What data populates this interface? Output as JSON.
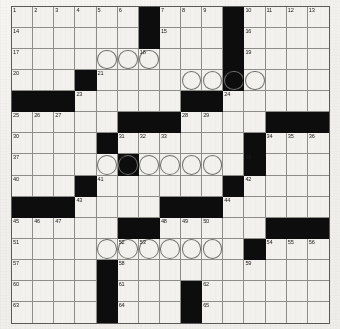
{
  "puzzle": {
    "type": "crossword-grid",
    "rows": 15,
    "columns": 15,
    "cell_size_px": 21.2,
    "colors": {
      "block": "#0d0d0d",
      "cell": "#f2f1ed",
      "grid_line": "#8d8d8a",
      "border": "#5a5a58",
      "paper": "#f1f0ec",
      "number_text": "#1b1b1b",
      "circle_stroke": "#6e6e6b"
    },
    "blocks": [
      [
        1,
        7
      ],
      [
        1,
        11
      ],
      [
        2,
        7
      ],
      [
        2,
        11
      ],
      [
        3,
        11
      ],
      [
        4,
        4
      ],
      [
        4,
        11
      ],
      [
        5,
        1
      ],
      [
        5,
        2
      ],
      [
        5,
        3
      ],
      [
        5,
        9
      ],
      [
        5,
        10
      ],
      [
        6,
        6
      ],
      [
        6,
        7
      ],
      [
        6,
        8
      ],
      [
        6,
        13
      ],
      [
        6,
        14
      ],
      [
        6,
        15
      ],
      [
        7,
        5
      ],
      [
        7,
        12
      ],
      [
        8,
        6
      ],
      [
        8,
        12
      ],
      [
        9,
        4
      ],
      [
        9,
        11
      ],
      [
        10,
        1
      ],
      [
        10,
        2
      ],
      [
        10,
        3
      ],
      [
        10,
        8
      ],
      [
        10,
        9
      ],
      [
        10,
        10
      ],
      [
        11,
        6
      ],
      [
        11,
        7
      ],
      [
        11,
        13
      ],
      [
        11,
        14
      ],
      [
        11,
        15
      ],
      [
        12,
        12
      ],
      [
        13,
        5
      ],
      [
        14,
        5
      ],
      [
        14,
        9
      ],
      [
        15,
        5
      ],
      [
        15,
        9
      ]
    ],
    "circles": [
      [
        3,
        5
      ],
      [
        3,
        6
      ],
      [
        3,
        7
      ],
      [
        4,
        9
      ],
      [
        4,
        10
      ],
      [
        4,
        11
      ],
      [
        4,
        12
      ],
      [
        8,
        5
      ],
      [
        8,
        6
      ],
      [
        8,
        7
      ],
      [
        8,
        8
      ],
      [
        8,
        9
      ],
      [
        8,
        10
      ],
      [
        12,
        5
      ],
      [
        12,
        6
      ],
      [
        12,
        7
      ],
      [
        12,
        8
      ],
      [
        12,
        9
      ],
      [
        12,
        10
      ]
    ],
    "numbers": [
      {
        "row": 1,
        "col": 1,
        "label": "1"
      },
      {
        "row": 1,
        "col": 2,
        "label": "2"
      },
      {
        "row": 1,
        "col": 3,
        "label": "3"
      },
      {
        "row": 1,
        "col": 4,
        "label": "4"
      },
      {
        "row": 1,
        "col": 5,
        "label": "5"
      },
      {
        "row": 1,
        "col": 6,
        "label": "6"
      },
      {
        "row": 1,
        "col": 8,
        "label": "7"
      },
      {
        "row": 1,
        "col": 9,
        "label": "8"
      },
      {
        "row": 1,
        "col": 10,
        "label": "9"
      },
      {
        "row": 1,
        "col": 12,
        "label": "10"
      },
      {
        "row": 1,
        "col": 13,
        "label": "11"
      },
      {
        "row": 1,
        "col": 14,
        "label": "12"
      },
      {
        "row": 1,
        "col": 15,
        "label": "13"
      },
      {
        "row": 2,
        "col": 1,
        "label": "14"
      },
      {
        "row": 2,
        "col": 8,
        "label": "15"
      },
      {
        "row": 2,
        "col": 12,
        "label": "16"
      },
      {
        "row": 3,
        "col": 1,
        "label": "17"
      },
      {
        "row": 3,
        "col": 7,
        "label": "18"
      },
      {
        "row": 3,
        "col": 12,
        "label": "19"
      },
      {
        "row": 4,
        "col": 1,
        "label": "20"
      },
      {
        "row": 4,
        "col": 5,
        "label": "21"
      },
      {
        "row": 4,
        "col": 11,
        "label": "22"
      },
      {
        "row": 5,
        "col": 4,
        "label": "23"
      },
      {
        "row": 5,
        "col": 11,
        "label": "24"
      },
      {
        "row": 6,
        "col": 1,
        "label": "25"
      },
      {
        "row": 6,
        "col": 2,
        "label": "26"
      },
      {
        "row": 6,
        "col": 3,
        "label": "27"
      },
      {
        "row": 6,
        "col": 9,
        "label": "28"
      },
      {
        "row": 6,
        "col": 10,
        "label": "29"
      },
      {
        "row": 7,
        "col": 1,
        "label": "30"
      },
      {
        "row": 7,
        "col": 6,
        "label": "31"
      },
      {
        "row": 7,
        "col": 7,
        "label": "32"
      },
      {
        "row": 7,
        "col": 8,
        "label": "33"
      },
      {
        "row": 7,
        "col": 13,
        "label": "34"
      },
      {
        "row": 7,
        "col": 14,
        "label": "35"
      },
      {
        "row": 7,
        "col": 15,
        "label": "36"
      },
      {
        "row": 8,
        "col": 1,
        "label": "37"
      },
      {
        "row": 8,
        "col": 6,
        "label": "38"
      },
      {
        "row": 8,
        "col": 12,
        "label": "39"
      },
      {
        "row": 9,
        "col": 1,
        "label": "40"
      },
      {
        "row": 9,
        "col": 5,
        "label": "41"
      },
      {
        "row": 9,
        "col": 12,
        "label": "42"
      },
      {
        "row": 10,
        "col": 4,
        "label": "43"
      },
      {
        "row": 10,
        "col": 11,
        "label": "44"
      },
      {
        "row": 11,
        "col": 1,
        "label": "45"
      },
      {
        "row": 11,
        "col": 2,
        "label": "46"
      },
      {
        "row": 11,
        "col": 3,
        "label": "47"
      },
      {
        "row": 11,
        "col": 8,
        "label": "48"
      },
      {
        "row": 11,
        "col": 9,
        "label": "49"
      },
      {
        "row": 11,
        "col": 10,
        "label": "50"
      },
      {
        "row": 12,
        "col": 1,
        "label": "51"
      },
      {
        "row": 12,
        "col": 6,
        "label": "52"
      },
      {
        "row": 12,
        "col": 7,
        "label": "53"
      },
      {
        "row": 12,
        "col": 13,
        "label": "54"
      },
      {
        "row": 12,
        "col": 14,
        "label": "55"
      },
      {
        "row": 12,
        "col": 15,
        "label": "56"
      },
      {
        "row": 13,
        "col": 1,
        "label": "57"
      },
      {
        "row": 13,
        "col": 6,
        "label": "58"
      },
      {
        "row": 13,
        "col": 12,
        "label": "59"
      },
      {
        "row": 14,
        "col": 1,
        "label": "60"
      },
      {
        "row": 14,
        "col": 6,
        "label": "61"
      },
      {
        "row": 14,
        "col": 10,
        "label": "62"
      },
      {
        "row": 15,
        "col": 1,
        "label": "63"
      },
      {
        "row": 15,
        "col": 6,
        "label": "64"
      },
      {
        "row": 15,
        "col": 10,
        "label": "65"
      }
    ],
    "entries": []
  }
}
